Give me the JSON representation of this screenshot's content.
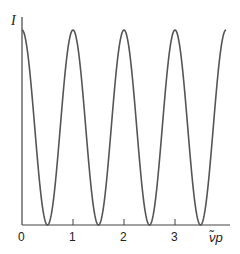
{
  "chart_data": {
    "type": "line",
    "title": "",
    "xlabel": "ν̃p",
    "ylabel": "I",
    "x_ticks": [
      "0",
      "1",
      "2",
      "3"
    ],
    "xlim": [
      0,
      4.05
    ],
    "ylim": [
      0,
      1.05
    ],
    "grid": false,
    "legend": null,
    "series": [
      {
        "name": "I",
        "function": "I = cos^2(pi * nu_p)",
        "x": [
          0,
          0.25,
          0.5,
          0.75,
          1,
          1.25,
          1.5,
          1.75,
          2,
          2.25,
          2.5,
          2.75,
          3,
          3.25,
          3.5,
          3.75,
          4
        ],
        "values": [
          1,
          0.5,
          0,
          0.5,
          1,
          0.5,
          0,
          0.5,
          1,
          0.5,
          0,
          0.5,
          1,
          0.5,
          0,
          0.5,
          1
        ]
      }
    ],
    "line_color": "#555555"
  }
}
